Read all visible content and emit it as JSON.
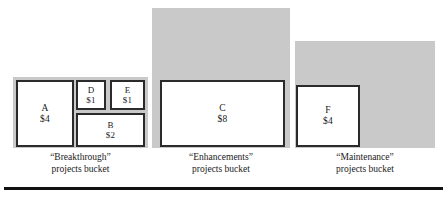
{
  "figure": {
    "type": "diagram",
    "background_color": "#ffffff",
    "bucket_fill_color": "#c9c9c9",
    "box_fill_color": "#ffffff",
    "box_border_color": "#2b2b2b",
    "rule_color": "#111111"
  },
  "buckets": [
    {
      "id": "breakthrough",
      "caption_line1": "“Breakthrough”",
      "caption_line2": "projects bucket",
      "backdrop": {
        "x": 13,
        "y": 77,
        "w": 135,
        "h": 71
      },
      "caption": {
        "x": 13,
        "y": 151,
        "w": 135
      },
      "projects": [
        {
          "id": "A",
          "label": "A",
          "value": "$4",
          "amount": 4,
          "x": 16,
          "y": 80,
          "w": 58,
          "h": 67,
          "size": "large"
        },
        {
          "id": "D",
          "label": "D",
          "value": "$1",
          "amount": 1,
          "x": 76,
          "y": 80,
          "w": 30,
          "h": 30,
          "size": "small"
        },
        {
          "id": "E",
          "label": "E",
          "value": "$1",
          "amount": 1,
          "x": 110,
          "y": 80,
          "w": 35,
          "h": 30,
          "size": "small"
        },
        {
          "id": "B",
          "label": "B",
          "value": "$2",
          "amount": 2,
          "x": 76,
          "y": 113,
          "w": 69,
          "h": 34,
          "size": "small"
        }
      ]
    },
    {
      "id": "enhancements",
      "caption_line1": "“Enhancements”",
      "caption_line2": "projects bucket",
      "backdrop": {
        "x": 152,
        "y": 8,
        "w": 138,
        "h": 140
      },
      "caption": {
        "x": 152,
        "y": 151,
        "w": 138
      },
      "projects": [
        {
          "id": "C",
          "label": "C",
          "value": "$8",
          "amount": 8,
          "x": 160,
          "y": 80,
          "w": 125,
          "h": 67,
          "size": "large"
        }
      ]
    },
    {
      "id": "maintenance",
      "caption_line1": "“Maintenance”",
      "caption_line2": "projects bucket",
      "backdrop": {
        "x": 295,
        "y": 41,
        "w": 140,
        "h": 107
      },
      "caption": {
        "x": 295,
        "y": 151,
        "w": 140
      },
      "projects": [
        {
          "id": "F",
          "label": "F",
          "value": "$4",
          "amount": 4,
          "x": 296,
          "y": 85,
          "w": 64,
          "h": 62,
          "size": "large"
        }
      ]
    }
  ],
  "bottom_rule": {
    "x": 4,
    "y": 187,
    "w": 439,
    "h": 3
  }
}
